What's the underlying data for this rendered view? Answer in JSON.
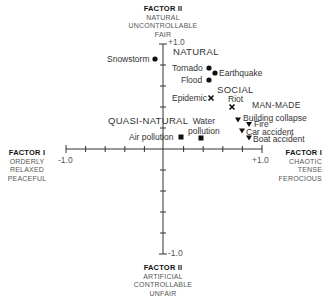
{
  "axes": {
    "factor2_top": {
      "title": "FACTOR II",
      "lines": [
        "NATURAL",
        "UNCONTROLLABLE",
        "FAIR"
      ],
      "tick": "+1.0"
    },
    "factor2_bottom": {
      "title": "FACTOR II",
      "lines": [
        "ARTIFICIAL",
        "CONTROLLABLE",
        "UNFAIR"
      ],
      "tick": "-1.0"
    },
    "factor1_left": {
      "title": "FACTOR I",
      "lines": [
        "ORDERLY",
        "RELAXED",
        "PEACEFUL"
      ],
      "tick": "-1.0"
    },
    "factor1_right": {
      "title": "FACTOR I",
      "lines": [
        "CHAOTIC",
        "TENSE",
        "FEROCIOUS"
      ],
      "tick": "+1.0"
    }
  },
  "groups": {
    "natural": "NATURAL",
    "social": "SOCIAL",
    "man_made": "MAN-MADE",
    "quasi_natural": "QUASI-NATURAL"
  },
  "points": [
    {
      "label": "Snowstorm",
      "group": "natural",
      "marker": "circle"
    },
    {
      "label": "Tornado",
      "group": "natural",
      "marker": "circle"
    },
    {
      "label": "Earthquake",
      "group": "natural",
      "marker": "circle"
    },
    {
      "label": "Flood",
      "group": "natural",
      "marker": "circle"
    },
    {
      "label": "Epidemic",
      "group": "social",
      "marker": "x"
    },
    {
      "label": "Riot",
      "group": "social",
      "marker": "x"
    },
    {
      "label": "Building collapse",
      "group": "man_made",
      "marker": "triangle-down"
    },
    {
      "label": "Fire",
      "group": "man_made",
      "marker": "triangle-down"
    },
    {
      "label": "Car accident",
      "group": "man_made",
      "marker": "triangle-down"
    },
    {
      "label": "Boat accident",
      "group": "man_made",
      "marker": "triangle-down"
    },
    {
      "label": "Air pollution",
      "group": "quasi_natural",
      "marker": "square"
    },
    {
      "label": "Water pollution",
      "group": "quasi_natural",
      "marker": "square"
    }
  ],
  "water_pollution_lines": [
    "Water",
    "pollution"
  ]
}
